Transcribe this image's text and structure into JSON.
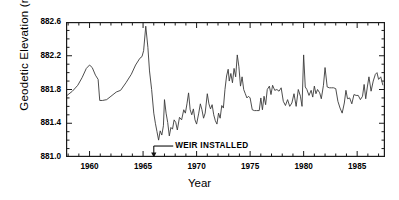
{
  "chart_data": {
    "type": "line",
    "title": "",
    "xlabel": "Year",
    "ylabel": "Geodetic Elevation (m)",
    "xlim": [
      1957.8,
      1987.6
    ],
    "ylim": [
      881.0,
      882.6
    ],
    "grid": false,
    "legend": null,
    "y_ticks": [
      "882.6",
      "882.2",
      "881.8",
      "881.4",
      "881.0"
    ],
    "y_tick_values": [
      882.6,
      882.2,
      881.8,
      881.4,
      881.0
    ],
    "y_minor_tick_step": 0.1,
    "x_ticks": [
      "1960",
      "1965",
      "1970",
      "1975",
      "1980",
      "1985"
    ],
    "x_tick_values": [
      1960,
      1965,
      1970,
      1975,
      1980,
      1985
    ],
    "x_minor_tick_step": 1,
    "annotations": [
      {
        "text": "WEIR INSTALLED",
        "x": 1966.0,
        "y": 881.0,
        "arrow": "down",
        "label_x": 1968.0,
        "label_y": 881.13
      }
    ],
    "series": [
      {
        "name": "Geodetic elevation",
        "color": "#3a3a3a",
        "points": [
          [
            1957.9,
            881.73
          ],
          [
            1958.4,
            881.78
          ],
          [
            1958.9,
            881.85
          ],
          [
            1959.3,
            881.94
          ],
          [
            1959.7,
            882.05
          ],
          [
            1960.0,
            882.09
          ],
          [
            1960.25,
            882.06
          ],
          [
            1960.55,
            881.97
          ],
          [
            1960.8,
            881.92
          ],
          [
            1960.95,
            881.67
          ],
          [
            1961.2,
            881.67
          ],
          [
            1961.6,
            881.68
          ],
          [
            1962.0,
            881.72
          ],
          [
            1962.5,
            881.77
          ],
          [
            1962.9,
            881.79
          ],
          [
            1963.4,
            881.88
          ],
          [
            1963.9,
            881.98
          ],
          [
            1964.3,
            882.09
          ],
          [
            1964.7,
            882.17
          ],
          [
            1964.9,
            882.19
          ],
          [
            1965.05,
            882.26
          ],
          [
            1965.25,
            882.55
          ],
          [
            1965.45,
            882.3
          ],
          [
            1965.6,
            882.02
          ],
          [
            1965.8,
            881.8
          ],
          [
            1966.0,
            881.52
          ],
          [
            1966.15,
            881.4
          ],
          [
            1966.3,
            881.3
          ],
          [
            1966.45,
            881.2
          ],
          [
            1966.6,
            881.31
          ],
          [
            1966.75,
            881.26
          ],
          [
            1966.9,
            881.37
          ],
          [
            1967.0,
            881.68
          ],
          [
            1967.15,
            881.52
          ],
          [
            1967.3,
            881.41
          ],
          [
            1967.45,
            881.25
          ],
          [
            1967.6,
            881.35
          ],
          [
            1967.75,
            881.33
          ],
          [
            1967.9,
            881.44
          ],
          [
            1968.05,
            881.41
          ],
          [
            1968.2,
            881.32
          ],
          [
            1968.4,
            881.47
          ],
          [
            1968.6,
            881.44
          ],
          [
            1968.8,
            881.56
          ],
          [
            1968.95,
            881.52
          ],
          [
            1969.1,
            881.63
          ],
          [
            1969.25,
            881.76
          ],
          [
            1969.4,
            881.56
          ],
          [
            1969.55,
            881.5
          ],
          [
            1969.7,
            881.57
          ],
          [
            1969.85,
            881.44
          ],
          [
            1970.0,
            881.39
          ],
          [
            1970.2,
            881.52
          ],
          [
            1970.35,
            881.63
          ],
          [
            1970.5,
            881.56
          ],
          [
            1970.65,
            881.46
          ],
          [
            1970.8,
            881.52
          ],
          [
            1971.0,
            881.75
          ],
          [
            1971.15,
            881.63
          ],
          [
            1971.3,
            881.57
          ],
          [
            1971.45,
            881.62
          ],
          [
            1971.6,
            881.5
          ],
          [
            1971.75,
            881.43
          ],
          [
            1971.9,
            881.39
          ],
          [
            1972.05,
            881.52
          ],
          [
            1972.2,
            881.46
          ],
          [
            1972.35,
            881.61
          ],
          [
            1972.5,
            881.58
          ],
          [
            1972.65,
            881.8
          ],
          [
            1972.8,
            881.96
          ],
          [
            1972.95,
            882.04
          ],
          [
            1973.05,
            881.9
          ],
          [
            1973.2,
            881.99
          ],
          [
            1973.35,
            881.88
          ],
          [
            1973.5,
            882.05
          ],
          [
            1973.65,
            881.95
          ],
          [
            1973.8,
            882.21
          ],
          [
            1973.95,
            882.07
          ],
          [
            1974.1,
            881.84
          ],
          [
            1974.25,
            881.95
          ],
          [
            1974.4,
            881.8
          ],
          [
            1974.55,
            881.75
          ],
          [
            1974.7,
            881.7
          ],
          [
            1974.85,
            881.72
          ],
          [
            1975.0,
            881.7
          ],
          [
            1975.2,
            881.56
          ],
          [
            1975.4,
            881.55
          ],
          [
            1975.6,
            881.55
          ],
          [
            1975.85,
            881.55
          ],
          [
            1976.0,
            881.7
          ],
          [
            1976.15,
            881.56
          ],
          [
            1976.3,
            881.72
          ],
          [
            1976.45,
            881.62
          ],
          [
            1976.6,
            881.8
          ],
          [
            1976.8,
            881.84
          ],
          [
            1976.95,
            881.74
          ],
          [
            1977.1,
            881.85
          ],
          [
            1977.3,
            881.79
          ],
          [
            1977.5,
            881.8
          ],
          [
            1977.7,
            881.78
          ],
          [
            1977.9,
            881.82
          ],
          [
            1978.1,
            881.66
          ],
          [
            1978.3,
            881.61
          ],
          [
            1978.5,
            881.68
          ],
          [
            1978.7,
            881.6
          ],
          [
            1978.9,
            881.64
          ],
          [
            1979.1,
            881.75
          ],
          [
            1979.3,
            881.6
          ],
          [
            1979.5,
            881.8
          ],
          [
            1979.7,
            881.72
          ],
          [
            1979.85,
            881.6
          ],
          [
            1980.0,
            882.21
          ],
          [
            1980.15,
            881.83
          ],
          [
            1980.3,
            881.8
          ],
          [
            1980.5,
            881.73
          ],
          [
            1980.7,
            881.79
          ],
          [
            1980.85,
            881.71
          ],
          [
            1981.0,
            881.84
          ],
          [
            1981.15,
            881.75
          ],
          [
            1981.3,
            881.8
          ],
          [
            1981.5,
            881.76
          ],
          [
            1981.65,
            881.69
          ],
          [
            1981.85,
            881.85
          ],
          [
            1982.0,
            882.06
          ],
          [
            1982.2,
            881.83
          ],
          [
            1982.4,
            881.82
          ],
          [
            1982.6,
            881.82
          ],
          [
            1982.8,
            881.82
          ],
          [
            1983.0,
            881.81
          ],
          [
            1983.2,
            881.66
          ],
          [
            1983.4,
            881.58
          ],
          [
            1983.6,
            881.52
          ],
          [
            1983.8,
            881.64
          ],
          [
            1983.95,
            881.79
          ],
          [
            1984.1,
            881.69
          ],
          [
            1984.3,
            881.7
          ],
          [
            1984.5,
            881.63
          ],
          [
            1984.7,
            881.74
          ],
          [
            1984.9,
            881.73
          ],
          [
            1985.1,
            881.73
          ],
          [
            1985.3,
            881.68
          ],
          [
            1985.5,
            881.72
          ],
          [
            1985.65,
            881.86
          ],
          [
            1985.8,
            881.69
          ],
          [
            1985.95,
            881.83
          ],
          [
            1986.1,
            881.95
          ],
          [
            1986.3,
            881.78
          ],
          [
            1986.5,
            881.9
          ],
          [
            1986.7,
            881.98
          ],
          [
            1986.85,
            882.0
          ],
          [
            1987.0,
            881.92
          ],
          [
            1987.2,
            881.95
          ],
          [
            1987.4,
            881.85
          ]
        ]
      }
    ]
  }
}
